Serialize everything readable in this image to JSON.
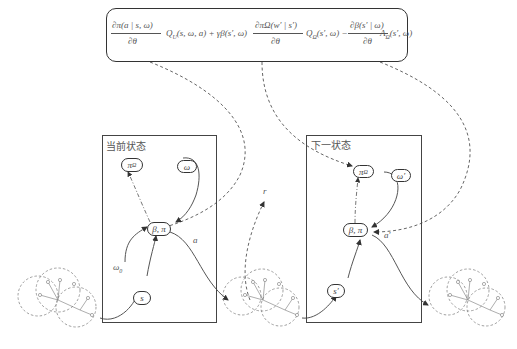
{
  "formula": {
    "term1_num": "∂π(a | s, ω)",
    "term1_den": "∂θ",
    "term1_q": "Q",
    "term1_q_sub": "U",
    "term1_q_args": "(s, ω, a) + γβ(s′, ω)",
    "term2_num": "∂πΩ(w′ | s′)",
    "term2_den": "∂θ",
    "term2_q": "Q",
    "term2_q_sub": "Ω",
    "term2_q_args": "(s′, ω) −",
    "term3_num": "∂β(s′ | ω)",
    "term3_den": "∂θ",
    "term3_a": "A",
    "term3_a_sub": "Ω",
    "term3_a_args": "(s′, ω)"
  },
  "current_state": {
    "label": "当前状态",
    "nodes": {
      "pi_omega": "π",
      "pi_omega_sub": "Ω",
      "omega": "ω",
      "beta_pi": "β, π",
      "s": "s"
    },
    "edge_labels": {
      "action": "a",
      "omega0": "ω",
      "omega0_sub": "0"
    }
  },
  "next_state": {
    "label": "下一状态",
    "nodes": {
      "pi_omega": "π",
      "pi_omega_sub": "Ω",
      "omega": "ω′",
      "beta_pi": "β, π",
      "s": "s′"
    },
    "edge_labels": {
      "action": "a′"
    }
  },
  "reward_label": "r"
}
